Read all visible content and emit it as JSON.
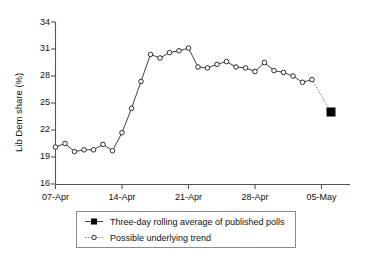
{
  "chart_data": {
    "type": "line",
    "title": "",
    "xlabel": "",
    "ylabel": "Lib Dem share (%)",
    "ylim": [
      16,
      34
    ],
    "yticks": [
      16,
      19,
      22,
      25,
      28,
      31,
      34
    ],
    "ytick_labels": [
      "16",
      "19",
      "22",
      "25",
      "28",
      "31",
      "34"
    ],
    "xlim": [
      "07-Apr",
      "06-May"
    ],
    "xticks": [
      "07-Apr",
      "14-Apr",
      "21-Apr",
      "28-Apr",
      "05-May"
    ],
    "xtick_labels": [
      "07-Apr",
      "14-Apr",
      "21-Apr",
      "28-Apr",
      "05-May"
    ],
    "grid": false,
    "legend_position": "below-plot",
    "series": [
      {
        "name": "Possible underlying trend",
        "marker": "open-circle",
        "linestyle": "solid",
        "x": [
          "07-Apr",
          "08-Apr",
          "09-Apr",
          "10-Apr",
          "11-Apr",
          "12-Apr",
          "13-Apr",
          "14-Apr",
          "15-Apr",
          "16-Apr",
          "17-Apr",
          "18-Apr",
          "19-Apr",
          "20-Apr",
          "21-Apr",
          "22-Apr",
          "23-Apr",
          "24-Apr",
          "25-Apr",
          "26-Apr",
          "27-Apr",
          "28-Apr",
          "29-Apr",
          "30-Apr",
          "01-May",
          "02-May",
          "03-May",
          "04-May"
        ],
        "values": [
          20.1,
          20.5,
          19.6,
          19.8,
          19.8,
          20.4,
          19.7,
          21.7,
          24.4,
          27.4,
          30.4,
          30.0,
          30.6,
          30.8,
          31.1,
          29.0,
          28.9,
          29.3,
          29.6,
          29.0,
          28.9,
          28.5,
          29.5,
          28.6,
          28.4,
          28.0,
          27.3,
          27.6
        ]
      },
      {
        "name": "Three-day rolling average of published polls",
        "marker": "filled-square",
        "linestyle": "dotted-connector",
        "x": [
          "06-May"
        ],
        "values": [
          24.0
        ]
      }
    ],
    "annotations": [
      {
        "kind": "dotted-projection",
        "from_x": "04-May",
        "from_y": 27.6,
        "to_x": "06-May",
        "to_y": 24.0
      }
    ]
  },
  "legend": {
    "entries": [
      {
        "label": "Three-day rolling average of published polls",
        "marker": "filled-square",
        "linestyle": "solid"
      },
      {
        "label": "Possible underlying trend",
        "marker": "open-circle",
        "linestyle": "dotted"
      }
    ]
  },
  "colors": {
    "line": "#2b2b2b",
    "trend": "#777777",
    "axis": "#555555",
    "marker_fill": "#ffffff",
    "marker_stroke": "#1a1a1a",
    "solid_marker": "#000000",
    "background": "#ffffff",
    "text": "#111111",
    "legend_border": "#8a8a8a"
  }
}
